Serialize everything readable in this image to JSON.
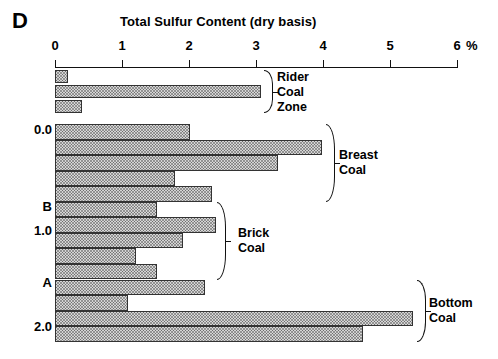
{
  "panel": {
    "letter": "D"
  },
  "chart_data": {
    "type": "bar",
    "orientation": "horizontal",
    "title": "Total Sulfur Content (dry basis)",
    "xlabel": "%",
    "ylabel": "",
    "xlim": [
      0,
      6
    ],
    "xticks": [
      0,
      1,
      2,
      3,
      4,
      5,
      6
    ],
    "xtick_labels": [
      "0",
      "1",
      "2",
      "3",
      "4",
      "5",
      "6"
    ],
    "x_unit_suffix": "%",
    "yticks": [
      "0.0",
      "B",
      "1.0",
      "A",
      "2.0"
    ],
    "grid": false,
    "legend": "none",
    "groups": [
      {
        "name": "Rider Coal Zone",
        "label_lines": [
          "Rider",
          "Coal",
          "Zone"
        ],
        "values": [
          0.19,
          3.07,
          0.4
        ]
      },
      {
        "name": "Breast Coal",
        "label_lines": [
          "Breast",
          "Coal"
        ],
        "values": [
          2.01,
          3.99,
          3.33,
          1.79,
          2.34
        ]
      },
      {
        "name": "Brick Coal",
        "label_lines": [
          "Brick",
          "Coal"
        ],
        "values": [
          1.52,
          2.4,
          1.91,
          1.21,
          1.52
        ]
      },
      {
        "name": "Bottom Coal",
        "label_lines": [
          "Bottom",
          "Coal"
        ],
        "values": [
          2.24,
          1.09,
          5.34,
          4.6
        ]
      }
    ],
    "values_flat_main": [
      2.01,
      3.99,
      3.33,
      1.79,
      2.34,
      1.52,
      2.4,
      1.91,
      1.21,
      1.52,
      2.24,
      1.09,
      5.34,
      4.6
    ]
  }
}
